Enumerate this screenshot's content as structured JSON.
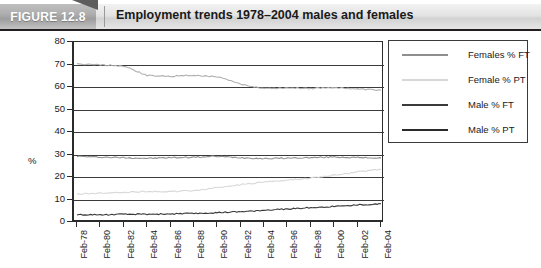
{
  "header": {
    "figure_label": "FIGURE 12.8",
    "title": "Employment trends 1978–2004 males and females"
  },
  "chart_data": {
    "type": "line",
    "title": "Employment trends 1978–2004 males and females",
    "xlabel": "",
    "ylabel": "%",
    "ylim": [
      0,
      80
    ],
    "ytick_labels": [
      "0",
      "10",
      "20",
      "30",
      "40",
      "50",
      "60",
      "70",
      "80"
    ],
    "yticks": [
      0,
      10,
      20,
      30,
      40,
      50,
      60,
      70,
      80
    ],
    "grid": true,
    "legend_position": "right",
    "x": [
      "Feb-78",
      "Feb-80",
      "Feb-82",
      "Feb-84",
      "Feb-86",
      "Feb-88",
      "Feb-90",
      "Feb-92",
      "Feb-94",
      "Feb-96",
      "Feb-98",
      "Feb-00",
      "Feb-02",
      "Feb-04"
    ],
    "categories": [
      "Feb-78",
      "Feb-80",
      "Feb-82",
      "Feb-84",
      "Feb-86",
      "Feb-88",
      "Feb-90",
      "Feb-92",
      "Feb-94",
      "Feb-96",
      "Feb-98",
      "Feb-00",
      "Feb-02",
      "Feb-04"
    ],
    "series": [
      {
        "name": "Females % FT",
        "color": "#8f8f8f",
        "values": [
          29.2,
          28.8,
          28.6,
          28.3,
          28.6,
          28.8,
          29.2,
          28.6,
          28.2,
          28.4,
          28.6,
          28.9,
          28.6,
          28.5
        ]
      },
      {
        "name": "Female % PT",
        "color": "#d8d8d8",
        "values": [
          12.4,
          12.8,
          13.2,
          13.6,
          13.5,
          13.9,
          15.3,
          16.6,
          17.8,
          18.6,
          19.6,
          20.8,
          22.4,
          23.4
        ]
      },
      {
        "name": "Male % FT",
        "color": "#b0b0b0",
        "values": [
          70.2,
          69.8,
          69.3,
          65.1,
          64.8,
          65.2,
          64.6,
          61.2,
          59.4,
          59.6,
          59.4,
          59.8,
          59.1,
          58.6
        ]
      },
      {
        "name": "Male % PT",
        "color": "#3a3a3a",
        "values": [
          3.2,
          3.2,
          3.4,
          3.5,
          3.6,
          3.8,
          4.1,
          4.5,
          5.2,
          5.8,
          6.4,
          6.9,
          7.6,
          8.1
        ]
      }
    ],
    "legend": [
      {
        "label": "Females % FT",
        "color": "#8f8f8f"
      },
      {
        "label": "Female % PT",
        "color": "#d8d8d8"
      },
      {
        "label": "Male % FT",
        "color": "#3a3a3a"
      },
      {
        "label": "Male % PT",
        "color": "#2b2b2b"
      }
    ]
  }
}
